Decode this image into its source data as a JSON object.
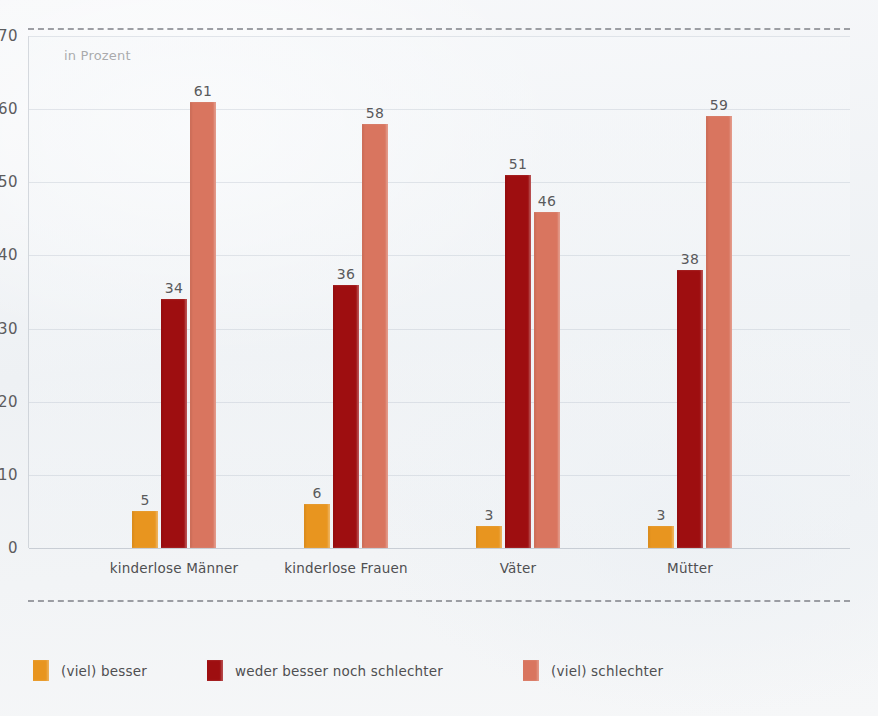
{
  "chart_data": {
    "type": "bar",
    "title": "",
    "subtitle": "",
    "unit_label": "in Prozent",
    "xlabel": "",
    "ylabel": "in Prozent",
    "ylim": [
      0,
      70
    ],
    "yticks": [
      0,
      10,
      20,
      30,
      40,
      50,
      60,
      70
    ],
    "ytick_labels": [
      "0",
      "10",
      "20",
      "30",
      "40",
      "50",
      "60",
      "70"
    ],
    "grid": true,
    "legend_position": "bottom",
    "categories": [
      "kinderlose Männer",
      "kinderlose Frauen",
      "Väter",
      "Mütter"
    ],
    "series": [
      {
        "name": "(viel) besser",
        "color": "#E8951F",
        "values": [
          5,
          6,
          3,
          3
        ],
        "value_labels": [
          "5",
          "6",
          "3",
          "3"
        ]
      },
      {
        "name": "weder besser noch schlechter",
        "color": "#9E0E10",
        "values": [
          34,
          36,
          51,
          38
        ],
        "value_labels": [
          "34",
          "36",
          "51",
          "38"
        ]
      },
      {
        "name": "(viel) schlechter",
        "color": "#D9755F",
        "values": [
          61,
          58,
          46,
          59
        ],
        "value_labels": [
          "61",
          "58",
          "46",
          "59"
        ]
      }
    ]
  },
  "colors": {
    "series_better": "#E8951F",
    "series_neutral": "#9E0E10",
    "series_worse": "#D9755F",
    "text": "#4f4f51",
    "background": "#f4f6f8"
  }
}
